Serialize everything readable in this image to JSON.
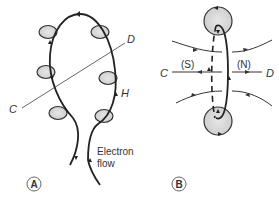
{
  "figure": {
    "panel_a": {
      "badge": "A",
      "label_c": "C",
      "label_d": "D",
      "label_h": "H",
      "flow_line1": "Electron",
      "flow_line2": "flow"
    },
    "panel_b": {
      "badge": "B",
      "label_c": "C",
      "label_d": "D",
      "label_s": "(S)",
      "label_n": "(N)"
    }
  },
  "colors": {
    "line": "#222222",
    "thin_line": "#555555",
    "shade": "#d8d8d8",
    "text": "#333333"
  }
}
